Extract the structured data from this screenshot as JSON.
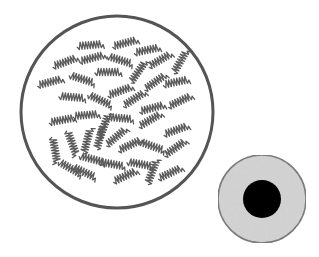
{
  "canvas": {
    "width": 319,
    "height": 257,
    "background": "#ffffff"
  },
  "large_cell": {
    "label": "large cell with coiled strands",
    "cx": 117,
    "cy": 112,
    "r": 96,
    "stroke": "#555555",
    "stroke_width": 3,
    "fill": "#ffffff"
  },
  "coil_style": {
    "stroke": "#5a5a5a",
    "stroke_width": 1.3,
    "length": 22,
    "amplitude": 3.6,
    "turns": 8
  },
  "coils": [
    {
      "x": 90,
      "y": 45,
      "a": -5
    },
    {
      "x": 125,
      "y": 43,
      "a": -15
    },
    {
      "x": 147,
      "y": 50,
      "a": -12
    },
    {
      "x": 65,
      "y": 62,
      "a": -20
    },
    {
      "x": 92,
      "y": 58,
      "a": -15
    },
    {
      "x": 120,
      "y": 60,
      "a": 18
    },
    {
      "x": 160,
      "y": 60,
      "a": -30
    },
    {
      "x": 180,
      "y": 62,
      "a": -60
    },
    {
      "x": 50,
      "y": 82,
      "a": -15
    },
    {
      "x": 82,
      "y": 79,
      "a": 18
    },
    {
      "x": 108,
      "y": 72,
      "a": 0
    },
    {
      "x": 138,
      "y": 72,
      "a": -55
    },
    {
      "x": 155,
      "y": 82,
      "a": -35
    },
    {
      "x": 176,
      "y": 82,
      "a": -12
    },
    {
      "x": 72,
      "y": 97,
      "a": 5
    },
    {
      "x": 100,
      "y": 100,
      "a": 25
    },
    {
      "x": 120,
      "y": 91,
      "a": -20
    },
    {
      "x": 134,
      "y": 99,
      "a": -32
    },
    {
      "x": 152,
      "y": 108,
      "a": -15
    },
    {
      "x": 180,
      "y": 101,
      "a": -25
    },
    {
      "x": 62,
      "y": 120,
      "a": -10
    },
    {
      "x": 86,
      "y": 115,
      "a": -5
    },
    {
      "x": 120,
      "y": 118,
      "a": 5
    },
    {
      "x": 104,
      "y": 126,
      "a": -70
    },
    {
      "x": 150,
      "y": 120,
      "a": -30
    },
    {
      "x": 176,
      "y": 130,
      "a": -20
    },
    {
      "x": 55,
      "y": 150,
      "a": 80
    },
    {
      "x": 72,
      "y": 143,
      "a": 70
    },
    {
      "x": 87,
      "y": 141,
      "a": -75
    },
    {
      "x": 100,
      "y": 137,
      "a": -75
    },
    {
      "x": 116,
      "y": 137,
      "a": -40
    },
    {
      "x": 130,
      "y": 145,
      "a": -25
    },
    {
      "x": 152,
      "y": 146,
      "a": 20
    },
    {
      "x": 175,
      "y": 148,
      "a": -35
    },
    {
      "x": 92,
      "y": 159,
      "a": 15
    },
    {
      "x": 112,
      "y": 164,
      "a": 10
    },
    {
      "x": 84,
      "y": 172,
      "a": 25
    },
    {
      "x": 125,
      "y": 176,
      "a": -25
    },
    {
      "x": 140,
      "y": 164,
      "a": 10
    },
    {
      "x": 152,
      "y": 172,
      "a": -70
    },
    {
      "x": 170,
      "y": 173,
      "a": -25
    },
    {
      "x": 70,
      "y": 168,
      "a": 30
    }
  ],
  "small_cell": {
    "label": "small cell with dark nucleus",
    "cx": 262,
    "cy": 199,
    "r": 44,
    "stroke": "#666666",
    "stroke_width": 1.5,
    "fill": "#d6d6d6",
    "nucleus": {
      "cx": 262,
      "cy": 199,
      "r": 19,
      "fill": "#000000"
    }
  }
}
